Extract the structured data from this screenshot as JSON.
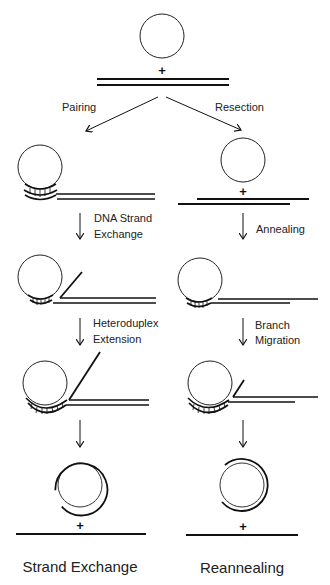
{
  "diagram": {
    "start": {
      "plus": "+"
    },
    "branches": {
      "left_label": "Pairing",
      "right_label": "Resection"
    },
    "left_pathway": {
      "steps": [
        "DNA Strand",
        "Exchange",
        "Heteroduplex",
        "Extension"
      ],
      "final_plus": "+",
      "title": "Strand Exchange"
    },
    "right_pathway": {
      "resected_plus": "+",
      "steps": [
        "Annealing",
        "Branch",
        "Migration"
      ],
      "final_plus": "+",
      "title": "Reannealing"
    },
    "colors": {
      "line": "#111111",
      "background": "#ffffff"
    }
  }
}
